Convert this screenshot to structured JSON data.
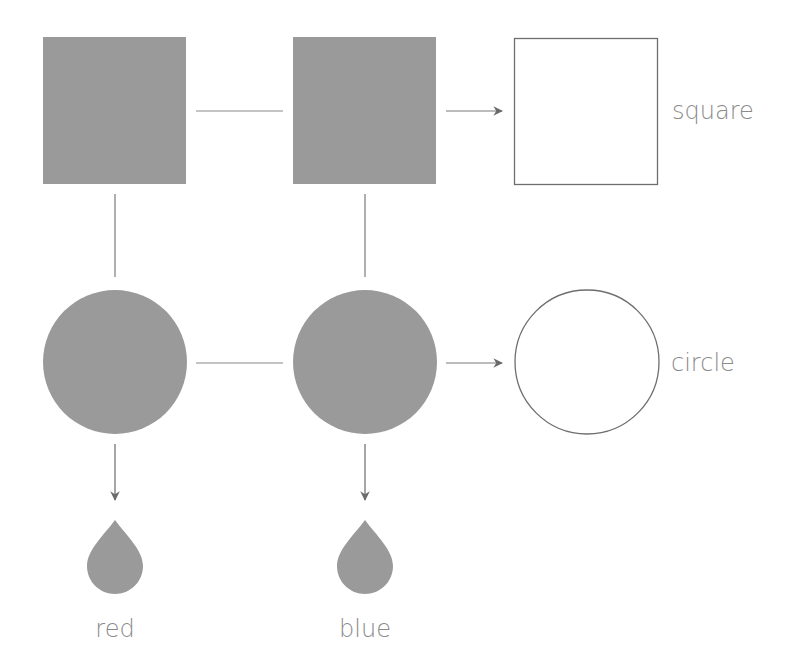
{
  "colors": {
    "fill": "#9a9a9a",
    "line": "#7a7a7a",
    "outline": "#6e6e6e",
    "text": "#8a8a8a",
    "background": "#ffffff"
  },
  "diagram": {
    "rows": [
      {
        "shape": "square",
        "label": "square"
      },
      {
        "shape": "circle",
        "label": "circle"
      }
    ],
    "columns": [
      {
        "label": "red",
        "icon": "drop-icon"
      },
      {
        "label": "blue",
        "icon": "drop-icon"
      }
    ],
    "labels": {
      "square": "square",
      "circle": "circle",
      "red": "red",
      "blue": "blue"
    }
  }
}
